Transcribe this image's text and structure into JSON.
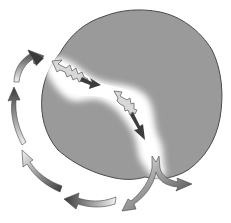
{
  "diagram": {
    "type": "schematic",
    "colors": {
      "background": "#ffffff",
      "body_fill": "#9a9a9a",
      "body_outline": "#4a4a4a",
      "fracture": "#ffffff",
      "arrow_dark": "#3c3c3c",
      "arrow_light": "#eeeeee"
    },
    "labels": []
  }
}
